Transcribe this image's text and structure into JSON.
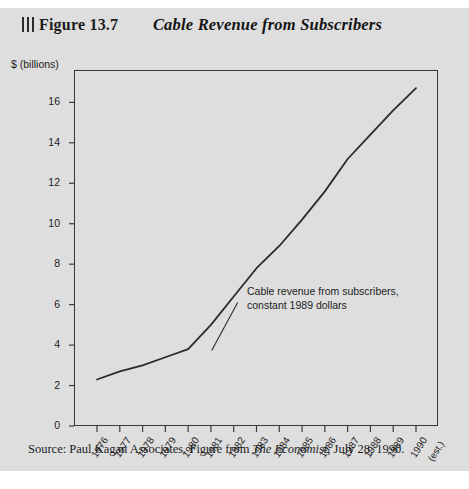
{
  "figure": {
    "number_label": "Figure 13.7",
    "title": "Cable Revenue from Subscribers",
    "rule_marks": 3
  },
  "source": {
    "prefix": "Source:  Paul Kagan Associates. Figure from ",
    "publication": "The Economist",
    "suffix": ", July 28, 1990."
  },
  "chart_data": {
    "type": "line",
    "title": "Cable Revenue from Subscribers",
    "xlabel": "",
    "ylabel": "$ (billions)",
    "ylim": [
      0,
      17.6
    ],
    "yticks": [
      0,
      2,
      4,
      6,
      8,
      10,
      12,
      14,
      16
    ],
    "ytick_labels": [
      "0",
      "2",
      "4",
      "6",
      "8",
      "10",
      "12",
      "14",
      "16"
    ],
    "grid": false,
    "legend": "none",
    "categories": [
      "1976",
      "1977",
      "1978",
      "1979",
      "1980",
      "1981",
      "1982",
      "1983",
      "1984",
      "1985",
      "1986",
      "1987",
      "1988",
      "1989",
      "1990"
    ],
    "xtick_labels": [
      "1976",
      "1977",
      "1978",
      "1979",
      "1980",
      "1981",
      "1982",
      "1983",
      "1984",
      "1985",
      "1986",
      "1987",
      "1988",
      "1989",
      "1990"
    ],
    "last_tick_note": "(est.)",
    "series": [
      {
        "name": "Cable revenue from subscribers, constant 1989 dollars",
        "values": [
          2.3,
          2.7,
          3.0,
          3.4,
          3.8,
          5.0,
          6.4,
          7.8,
          8.9,
          10.2,
          11.6,
          13.2,
          14.4,
          15.6,
          16.7
        ]
      }
    ],
    "annotations": [
      {
        "line1": "Cable revenue from subscribers,",
        "line2": "constant 1989 dollars",
        "has_leader_line": true
      }
    ],
    "colors": {
      "page_background": "#dedede",
      "line": "#2b2b2b",
      "axis": "#3a3a3a",
      "text": "#1c1c1c"
    }
  }
}
